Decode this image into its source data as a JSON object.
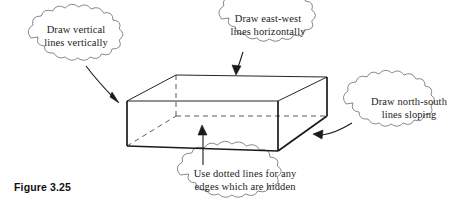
{
  "figure": {
    "caption": "Figure 3.25"
  },
  "callouts": [
    {
      "name": "draw-vertical-lines",
      "line1": "Draw vertical",
      "line2": "lines vertically",
      "arrow_points_to": "front-left-vertical-edge"
    },
    {
      "name": "draw-east-west-lines",
      "line1": "Draw east-west",
      "line2": "lines horizontally",
      "arrow_points_to": "top-back-horizontal-edge"
    },
    {
      "name": "draw-north-south-lines",
      "line1": "Draw north-south",
      "line2": "lines sloping",
      "arrow_points_to": "bottom-right-sloping-edge"
    },
    {
      "name": "use-dotted-lines",
      "line1": "Use dotted lines for any",
      "line2": "edges which are hidden",
      "arrow_points_to": "hidden-bottom-back-edge"
    }
  ],
  "colors": {
    "ink": "#1a1a1a",
    "ink_light": "#55555a",
    "cloud_stroke": "#6d6d72",
    "background": "#ffffff"
  },
  "cuboid": {
    "vertices": {
      "front_top_left": [
        127,
        101
      ],
      "front_top_right": [
        278,
        101
      ],
      "front_bottom_left": [
        127,
        146
      ],
      "front_bottom_right": [
        278,
        151
      ],
      "back_top_left": [
        176,
        75
      ],
      "back_top_right": [
        327,
        77
      ],
      "back_bottom_left": [
        176,
        116
      ],
      "back_bottom_right": [
        327,
        116
      ]
    },
    "visible_edges": [
      "front-top",
      "front-left-vertical",
      "front-right-vertical",
      "front-bottom",
      "top-back",
      "top-left-slope",
      "top-right-slope",
      "right-vertical",
      "bottom-right-slope"
    ],
    "hidden_edges": [
      "back-left-vertical",
      "back-bottom-horizontal",
      "bottom-left-slope"
    ]
  }
}
